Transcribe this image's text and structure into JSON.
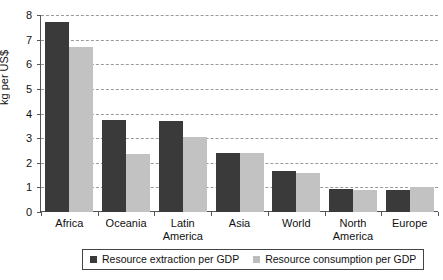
{
  "chart_data": {
    "type": "bar",
    "title": "",
    "xlabel": "",
    "ylabel": "kg per US$",
    "ylim": [
      0,
      8
    ],
    "yticks": [
      0,
      1,
      2,
      3,
      4,
      5,
      6,
      7,
      8
    ],
    "grid": true,
    "legend_position": "bottom",
    "categories": [
      "Africa",
      "Oceania",
      "Latin America",
      "Asia",
      "World",
      "North America",
      "Europe"
    ],
    "series": [
      {
        "name": "Resource extraction per GDP",
        "color": "#3a3a3a",
        "values": [
          7.7,
          3.75,
          3.7,
          2.4,
          1.65,
          0.95,
          0.9
        ]
      },
      {
        "name": "Resource consumption per GDP",
        "color": "#c2c2c2",
        "values": [
          6.7,
          2.35,
          3.05,
          2.4,
          1.6,
          0.9,
          1.0
        ]
      }
    ]
  },
  "legend": {
    "entries": [
      {
        "label": "Resource extraction per GDP"
      },
      {
        "label": "Resource consumption per GDP"
      }
    ]
  },
  "colors": {
    "extraction": "#3a3a3a",
    "consumption": "#c2c2c2",
    "axis": "#555555",
    "grid": "#9a9a9a",
    "background": "#ffffff"
  }
}
